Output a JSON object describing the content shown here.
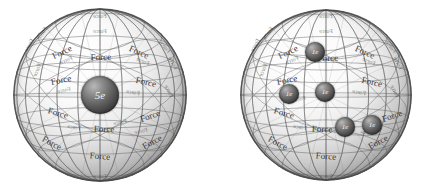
{
  "figure": {
    "title": "",
    "background_color": "#ffffff",
    "panels": [
      {
        "id": "left-panel",
        "name": "nucleus-sphere",
        "center_charge": {
          "label": "5e",
          "radius_px": 19
        },
        "orbiting_charges": [],
        "force_label": "Force",
        "sphere": {
          "cx": 100,
          "cy": 95,
          "r": 87
        }
      },
      {
        "id": "right-panel",
        "name": "electron-sphere",
        "center_charge": null,
        "orbiting_charges": [
          {
            "label": "1e",
            "x": 315,
            "y": 52,
            "r": 10
          },
          {
            "label": "1e",
            "x": 289,
            "y": 94,
            "r": 10
          },
          {
            "label": "1e",
            "x": 325,
            "y": 92,
            "r": 10
          },
          {
            "label": "1e",
            "x": 345,
            "y": 127,
            "r": 10
          },
          {
            "label": "1e",
            "x": 372,
            "y": 125,
            "r": 10
          }
        ],
        "force_label": "Force",
        "sphere": {
          "cx": 326,
          "cy": 95,
          "r": 86
        }
      }
    ],
    "colors": {
      "background": "#ffffff",
      "grid_line": "#555555",
      "sphere_shadow": "#3a3a3a",
      "label_text": "#2e2e2e",
      "charge_text": "#f2f2f2"
    },
    "force_labels_left": [
      {
        "text": "Force",
        "x": 29,
        "y": 45,
        "rot": -62,
        "layer": "back"
      },
      {
        "text": "Force",
        "x": 42,
        "y": 33,
        "rot": -55,
        "layer": "back"
      },
      {
        "text": "Force",
        "x": 62,
        "y": 52,
        "rot": -26,
        "layer": "front"
      },
      {
        "text": "Force",
        "x": 66,
        "y": 60,
        "rot": -24,
        "layer": "back"
      },
      {
        "text": "Force",
        "x": 101,
        "y": 57,
        "rot": -2,
        "layer": "front"
      },
      {
        "text": "Force",
        "x": 100,
        "y": 31,
        "rot": -1,
        "layer": "back"
      },
      {
        "text": "Force",
        "x": 139,
        "y": 52,
        "rot": 24,
        "layer": "front"
      },
      {
        "text": "Force",
        "x": 143,
        "y": 61,
        "rot": 22,
        "layer": "back"
      },
      {
        "text": "Force",
        "x": 165,
        "y": 47,
        "rot": 52,
        "layer": "back"
      },
      {
        "text": "Force",
        "x": 173,
        "y": 63,
        "rot": 62,
        "layer": "back"
      },
      {
        "text": "Force",
        "x": 37,
        "y": 70,
        "rot": -66,
        "layer": "back"
      },
      {
        "text": "Force",
        "x": 61,
        "y": 80,
        "rot": -12,
        "layer": "front"
      },
      {
        "text": "Force",
        "x": 64,
        "y": 90,
        "rot": -10,
        "layer": "back"
      },
      {
        "text": "Force",
        "x": 146,
        "y": 82,
        "rot": 12,
        "layer": "front"
      },
      {
        "text": "Force",
        "x": 133,
        "y": 92,
        "rot": 10,
        "layer": "back"
      },
      {
        "text": "Force",
        "x": 169,
        "y": 91,
        "rot": 64,
        "layer": "back"
      },
      {
        "text": "Force",
        "x": 58,
        "y": 113,
        "rot": 16,
        "layer": "front"
      },
      {
        "text": "Force",
        "x": 74,
        "y": 127,
        "rot": 10,
        "layer": "back"
      },
      {
        "text": "Force",
        "x": 104,
        "y": 129,
        "rot": 2,
        "layer": "front"
      },
      {
        "text": "Force",
        "x": 120,
        "y": 122,
        "rot": -9,
        "layer": "back"
      },
      {
        "text": "Force",
        "x": 150,
        "y": 116,
        "rot": -20,
        "layer": "front"
      },
      {
        "text": "Force",
        "x": 141,
        "y": 131,
        "rot": -14,
        "layer": "back"
      },
      {
        "text": "Force",
        "x": 52,
        "y": 143,
        "rot": 28,
        "layer": "front"
      },
      {
        "text": "Force",
        "x": 100,
        "y": 156,
        "rot": 4,
        "layer": "front"
      },
      {
        "text": "Force",
        "x": 152,
        "y": 142,
        "rot": -28,
        "layer": "front"
      },
      {
        "text": "Force",
        "x": 100,
        "y": 176,
        "rot": 2,
        "layer": "back"
      },
      {
        "text": "Force",
        "x": 100,
        "y": 16,
        "rot": 0,
        "layer": "back"
      }
    ],
    "force_labels_right": [
      {
        "text": "Force",
        "x": 255,
        "y": 45,
        "rot": -62,
        "layer": "back"
      },
      {
        "text": "Force",
        "x": 268,
        "y": 33,
        "rot": -55,
        "layer": "back"
      },
      {
        "text": "Force",
        "x": 288,
        "y": 52,
        "rot": -26,
        "layer": "front"
      },
      {
        "text": "Force",
        "x": 292,
        "y": 60,
        "rot": -24,
        "layer": "back"
      },
      {
        "text": "Force",
        "x": 328,
        "y": 58,
        "rot": -2,
        "layer": "front"
      },
      {
        "text": "Force",
        "x": 326,
        "y": 31,
        "rot": -1,
        "layer": "back"
      },
      {
        "text": "Force",
        "x": 365,
        "y": 52,
        "rot": 24,
        "layer": "front"
      },
      {
        "text": "Force",
        "x": 369,
        "y": 61,
        "rot": 22,
        "layer": "back"
      },
      {
        "text": "Force",
        "x": 391,
        "y": 47,
        "rot": 52,
        "layer": "back"
      },
      {
        "text": "Force",
        "x": 398,
        "y": 63,
        "rot": 62,
        "layer": "back"
      },
      {
        "text": "Force",
        "x": 263,
        "y": 70,
        "rot": -66,
        "layer": "back"
      },
      {
        "text": "Force",
        "x": 287,
        "y": 80,
        "rot": -12,
        "layer": "front"
      },
      {
        "text": "Force",
        "x": 299,
        "y": 99,
        "rot": -10,
        "layer": "back"
      },
      {
        "text": "Force",
        "x": 372,
        "y": 82,
        "rot": 12,
        "layer": "front"
      },
      {
        "text": "Force",
        "x": 359,
        "y": 92,
        "rot": 10,
        "layer": "back"
      },
      {
        "text": "Force",
        "x": 395,
        "y": 91,
        "rot": 64,
        "layer": "back"
      },
      {
        "text": "Force",
        "x": 284,
        "y": 113,
        "rot": 16,
        "layer": "front"
      },
      {
        "text": "Force",
        "x": 300,
        "y": 127,
        "rot": 10,
        "layer": "back"
      },
      {
        "text": "Force",
        "x": 322,
        "y": 129,
        "rot": 2,
        "layer": "front"
      },
      {
        "text": "Force",
        "x": 392,
        "y": 116,
        "rot": -20,
        "layer": "front"
      },
      {
        "text": "Force",
        "x": 367,
        "y": 131,
        "rot": -14,
        "layer": "back"
      },
      {
        "text": "Force",
        "x": 278,
        "y": 143,
        "rot": 28,
        "layer": "front"
      },
      {
        "text": "Force",
        "x": 326,
        "y": 156,
        "rot": 4,
        "layer": "front"
      },
      {
        "text": "Force",
        "x": 378,
        "y": 142,
        "rot": -28,
        "layer": "front"
      },
      {
        "text": "Force",
        "x": 326,
        "y": 176,
        "rot": 2,
        "layer": "back"
      },
      {
        "text": "Force",
        "x": 326,
        "y": 16,
        "rot": 0,
        "layer": "back"
      }
    ]
  }
}
